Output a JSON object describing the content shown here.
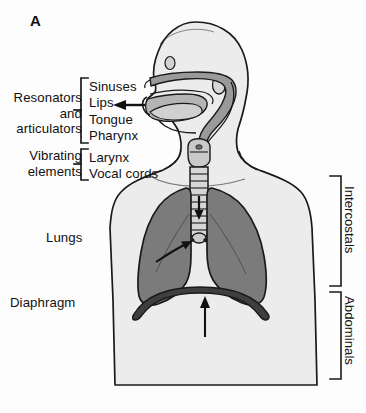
{
  "figure": {
    "panel_letter": "A",
    "background_color": "#fdfdfd",
    "ink_color": "#111111"
  },
  "left_groups": [
    {
      "id": "resonators",
      "caption": "Resonators\nand\narticulators",
      "items": [
        "Sinuses",
        "Lips",
        "Tongue",
        "Pharynx"
      ]
    },
    {
      "id": "vibrating",
      "caption": "Vibrating\nelements",
      "items": [
        "Larynx",
        "Vocal cords"
      ]
    }
  ],
  "items": {
    "sinuses": "Sinuses",
    "lips": "Lips",
    "tongue": "Tongue",
    "pharynx": "Pharynx",
    "larynx": "Larynx",
    "vocal_cords": "Vocal cords"
  },
  "group_captions": {
    "resonators": "Resonators\nand\narticulators",
    "vibrating": "Vibrating\nelements"
  },
  "organ_labels": {
    "lungs": "Lungs",
    "diaphragm": "Diaphragm"
  },
  "muscle_groups": {
    "intercostals": "Intercostals",
    "abdominals": "Abdominals"
  },
  "colors": {
    "outline": "#1a1a1a",
    "body_fill": "#ececec",
    "lung_fill": "#7b7b7b",
    "airway_fill": "#9a9a9a",
    "diaphragm_fill": "#3f3f3f",
    "paper": "#fdfdfd"
  },
  "arrows": {
    "mouth_airflow": "leftward arrow exiting the mouth",
    "bronchus_pointer": "arrow pointing up-right to right bronchus",
    "trachea_pointer": "small downward arrow inside trachea",
    "diaphragm_pointer": "upward arrow below diaphragm"
  }
}
